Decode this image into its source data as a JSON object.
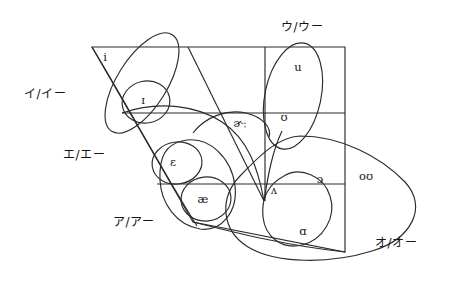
{
  "figure": {
    "type": "ipa-vowel-quadrilateral",
    "title": ""
  },
  "quadrilateral": {
    "top_left": [
      92,
      47
    ],
    "top_right": [
      345,
      47
    ],
    "bottom_right": [
      345,
      252
    ],
    "bottom_left": [
      193,
      222
    ],
    "horizontal_rows": [
      {
        "name": "close-mid-line",
        "y": 113,
        "x_start": 122,
        "x_end": 345
      },
      {
        "name": "open-mid-line",
        "y": 184,
        "x_start": 157,
        "x_end": 345
      }
    ],
    "vertical_dividers": [
      {
        "name": "front-central-divider",
        "top": [
          188,
          47
        ],
        "bottom": [
          264,
          201
        ]
      },
      {
        "name": "central-back-divider",
        "top": [
          265,
          47
        ],
        "bottom": [
          265,
          201
        ]
      }
    ],
    "bottom_edge": {
      "from": [
        193,
        222
      ],
      "to": [
        345,
        252
      ]
    }
  },
  "vowels": [
    {
      "id": "i",
      "symbol": "i",
      "x": 105,
      "y": 58,
      "group": "i-group"
    },
    {
      "id": "ih",
      "symbol": "ɪ",
      "x": 143,
      "y": 101,
      "group": "i-group"
    },
    {
      "id": "eh",
      "symbol": "ɛ",
      "x": 173,
      "y": 163,
      "group": "e-group"
    },
    {
      "id": "ae",
      "symbol": "æ",
      "x": 203,
      "y": 200,
      "group": "a-group"
    },
    {
      "id": "u",
      "symbol": "u",
      "x": 298,
      "y": 68,
      "group": "u-group"
    },
    {
      "id": "uh",
      "symbol": "ʊ",
      "x": 284,
      "y": 118,
      "group": "u-group"
    },
    {
      "id": "er",
      "symbol": "ɚː",
      "x": 240,
      "y": 124,
      "group": "none"
    },
    {
      "id": "wedge",
      "symbol": "ʌ",
      "x": 274,
      "y": 191,
      "group": "a-group"
    },
    {
      "id": "openo",
      "symbol": "ɔ",
      "x": 320,
      "y": 180,
      "group": "o-group"
    },
    {
      "id": "ou",
      "symbol": "oʊ",
      "x": 366,
      "y": 177,
      "group": "o-group"
    },
    {
      "id": "scripta",
      "symbol": "ɑ",
      "x": 303,
      "y": 232,
      "group": "o-group"
    }
  ],
  "kana_labels": [
    {
      "id": "kana-i",
      "text": "イ/イー",
      "x": 24,
      "y": 94,
      "align": "start",
      "group": "i-group"
    },
    {
      "id": "kana-u",
      "text": "ウ/ウー",
      "x": 281,
      "y": 27,
      "align": "start",
      "group": "u-group"
    },
    {
      "id": "kana-e",
      "text": "エ/エー",
      "x": 63,
      "y": 155,
      "align": "start",
      "group": "e-group"
    },
    {
      "id": "kana-a",
      "text": "ア/アー",
      "x": 113,
      "y": 222,
      "align": "start",
      "group": "a-group"
    },
    {
      "id": "kana-o",
      "text": "オ/オー",
      "x": 375,
      "y": 243,
      "align": "start",
      "group": "o-group"
    }
  ],
  "colors": {
    "stroke": "#2b2b2b",
    "text": "#141414",
    "background": "#ffffff"
  }
}
